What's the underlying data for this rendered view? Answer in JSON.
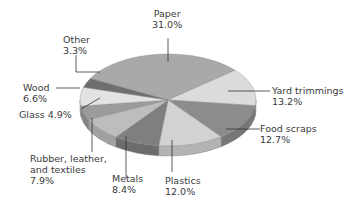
{
  "chart_data": {
    "type": "pie",
    "style": "3d",
    "title": "",
    "legend": "none",
    "slices": [
      {
        "label": "Paper",
        "value": 31.0,
        "pct_text": "31.0%",
        "color": "#a9a9a9"
      },
      {
        "label": "Yard trimmings",
        "value": 13.2,
        "pct_text": "13.2%",
        "color": "#dcdcdc"
      },
      {
        "label": "Food scraps",
        "value": 12.7,
        "pct_text": "12.7%",
        "color": "#8c8c8c"
      },
      {
        "label": "Plastics",
        "value": 12.0,
        "pct_text": "12.0%",
        "color": "#d2d2d2"
      },
      {
        "label": "Metals",
        "value": 8.4,
        "pct_text": "8.4%",
        "color": "#7f7f7f"
      },
      {
        "label": "Rubber, leather, and textiles",
        "value": 7.9,
        "pct_text": "7.9%",
        "color": "#bdbdbd"
      },
      {
        "label": "Glass",
        "value": 4.9,
        "pct_text": "4.9%",
        "color": "#9c9c9c"
      },
      {
        "label": "Wood",
        "value": 6.6,
        "pct_text": "6.6%",
        "color": "#e3e3e3"
      },
      {
        "label": "Other",
        "value": 3.3,
        "pct_text": "3.3%",
        "color": "#6f6f6f"
      }
    ]
  },
  "labels": {
    "paper": {
      "name": "Paper",
      "pct": "31.0%"
    },
    "yard": {
      "name": "Yard trimmings",
      "pct": "13.2%"
    },
    "food": {
      "name": "Food scraps",
      "pct": "12.7%"
    },
    "plastics": {
      "name": "Plastics",
      "pct": "12.0%"
    },
    "metals": {
      "name": "Metals",
      "pct": "8.4%"
    },
    "rubber": {
      "line1": "Rubber, leather,",
      "line2": "and textiles",
      "pct": "7.9%"
    },
    "glass": {
      "text": "Glass 4.9%"
    },
    "wood": {
      "name": "Wood",
      "pct": "6.6%"
    },
    "other": {
      "name": "Other",
      "pct": "3.3%"
    }
  }
}
